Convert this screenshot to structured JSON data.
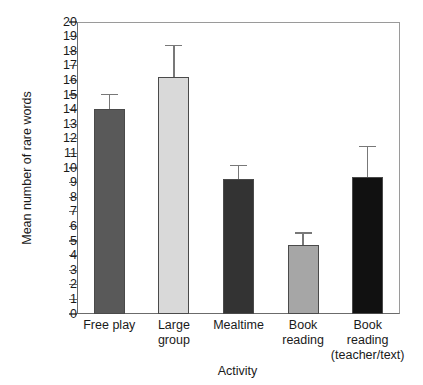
{
  "chart_data": {
    "type": "bar",
    "title": "",
    "xlabel": "Activity",
    "ylabel": "Mean number of rare words",
    "ylim": [
      0,
      20
    ],
    "ytick_step": 1,
    "grid": false,
    "legend": "none",
    "yticks": [
      "20",
      "19",
      "18",
      "17",
      "16",
      "15",
      "14",
      "13",
      "12",
      "11",
      "10",
      "9",
      "8",
      "7",
      "6",
      "5",
      "4",
      "3",
      "2",
      "1",
      "0"
    ],
    "categories": [
      "Free play",
      "Large group",
      "Mealtime",
      "Book reading",
      "Book reading (teacher/text)"
    ],
    "category_lines": [
      [
        "Free play"
      ],
      [
        "Large",
        "group"
      ],
      [
        "Mealtime"
      ],
      [
        "Book",
        "reading"
      ],
      [
        "Book",
        "reading",
        "(teacher/text)"
      ]
    ],
    "values": [
      14.05,
      16.2,
      9.25,
      4.7,
      9.4
    ],
    "errors_upper": [
      15.1,
      18.45,
      10.2,
      5.6,
      11.5
    ],
    "error_margins": [
      1.05,
      2.25,
      0.95,
      0.9,
      2.1
    ],
    "bar_colors": [
      "#595959",
      "#d9d9d9",
      "#333333",
      "#a6a6a6",
      "#111111"
    ],
    "bar_edge_color": "#4a4a4a",
    "error_color": "#787878",
    "axis_color": "#6b6b6b",
    "background": "#ffffff"
  }
}
